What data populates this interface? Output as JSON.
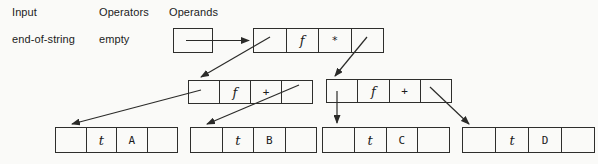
{
  "columns": {
    "input": "Input",
    "operators": "Operators",
    "operands": "Operands"
  },
  "state": {
    "input": "end-of-string",
    "operators": "empty"
  },
  "nodes": {
    "root": {
      "cells": [
        "",
        "f",
        "*",
        ""
      ]
    },
    "left": {
      "cells": [
        "",
        "f",
        "+",
        ""
      ]
    },
    "right": {
      "cells": [
        "",
        "f",
        "+",
        ""
      ]
    },
    "leaf_a": {
      "cells": [
        "",
        "t",
        "A",
        ""
      ]
    },
    "leaf_b": {
      "cells": [
        "",
        "t",
        "B",
        ""
      ]
    },
    "leaf_c": {
      "cells": [
        "",
        "t",
        "C",
        ""
      ]
    },
    "leaf_d": {
      "cells": [
        "",
        "t",
        "D",
        ""
      ]
    }
  },
  "colors": {
    "line": "#2b2b29",
    "background": "#fafaf8",
    "text": "#1c1c1c"
  }
}
